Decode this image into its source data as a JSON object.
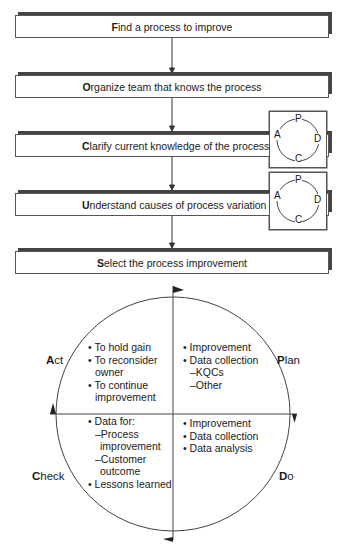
{
  "steps": [
    {
      "first": "F",
      "rest": "ind a process to improve"
    },
    {
      "first": "O",
      "rest": "rganize team that knows the process"
    },
    {
      "first": "C",
      "rest": "larify current knowledge of the process"
    },
    {
      "first": "U",
      "rest": "nderstand causes of process variation"
    },
    {
      "first": "S",
      "rest": "elect the process improvement"
    }
  ],
  "mini_cycle": {
    "p": "P",
    "d": "D",
    "c": "C",
    "a": "A"
  },
  "pdca": {
    "act": {
      "first": "A",
      "rest": "ct"
    },
    "plan": {
      "first": "P",
      "rest": "lan"
    },
    "check": {
      "first": "C",
      "rest": "heck"
    },
    "do": {
      "first": "D",
      "rest": "o"
    },
    "act_items": [
      "• To hold gain",
      "• To reconsider",
      "owner",
      "• To continue",
      "improvement"
    ],
    "plan_items": [
      "• Improvement",
      "• Data collection",
      "–KQCs",
      "–Other"
    ],
    "check_items": [
      "• Data for:",
      "–Process",
      "improvement",
      "–Customer",
      "outcome",
      "• Lessons learned"
    ],
    "do_items": [
      "• Improvement",
      "• Data collection",
      "• Data analysis"
    ]
  }
}
